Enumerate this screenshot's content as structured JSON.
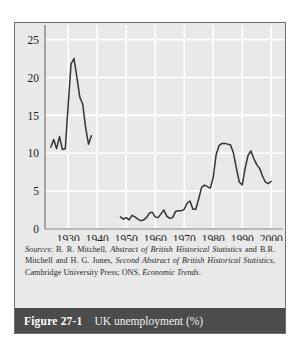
{
  "figure": {
    "number_label": "Figure 27-1",
    "title": "UK unemployment (%)",
    "caption_bar_color": "#4c4c4c",
    "caption_text_color": "#ffffff"
  },
  "sources": {
    "lead": "Sources",
    "colon": ": ",
    "part1": "B. R. Mitchell, ",
    "italic1": "Abstract of British Historical Statistics",
    "part2": " and B.R. Mitchell and H. G. Jones, ",
    "italic2": "Second Abstract of British Historical Statistics",
    "part3": ", Cambridge University Press; ONS, ",
    "italic3": "Economic Trends",
    "part4": "."
  },
  "chart_data": {
    "type": "line",
    "title": "UK unemployment (%)",
    "xlabel": "",
    "ylabel": "",
    "xlim": [
      1922,
      2002
    ],
    "ylim": [
      0,
      26
    ],
    "yticks": [
      0,
      5,
      10,
      15,
      20,
      25
    ],
    "xticks": [
      1930,
      1940,
      1950,
      1960,
      1970,
      1980,
      1990,
      2000
    ],
    "grid": true,
    "grid_color": "#ffffff",
    "plot_bg": "#e9e9e9",
    "line_color": "#333333",
    "legend": "none",
    "series": [
      {
        "name": "UK unemployment rate (interwar)",
        "x": [
          1924,
          1925,
          1926,
          1927,
          1928,
          1929,
          1930,
          1931,
          1932,
          1933,
          1934,
          1935,
          1936,
          1937,
          1938
        ],
        "values": [
          10.8,
          11.8,
          10.6,
          12.2,
          10.5,
          10.6,
          16.4,
          21.8,
          22.5,
          20.0,
          17.4,
          16.5,
          13.4,
          11.2,
          12.3
        ]
      },
      {
        "name": "UK unemployment rate (post-war)",
        "x": [
          1948,
          1949,
          1950,
          1951,
          1952,
          1953,
          1954,
          1955,
          1956,
          1957,
          1958,
          1959,
          1960,
          1961,
          1962,
          1963,
          1964,
          1965,
          1966,
          1967,
          1968,
          1969,
          1970,
          1971,
          1972,
          1973,
          1974,
          1975,
          1976,
          1977,
          1978,
          1979,
          1980,
          1981,
          1982,
          1983,
          1984,
          1985,
          1986,
          1987,
          1988,
          1989,
          1990,
          1991,
          1992,
          1993,
          1994,
          1995,
          1996,
          1997,
          1998,
          1999,
          2000
        ],
        "values": [
          1.6,
          1.3,
          1.5,
          1.2,
          1.8,
          1.6,
          1.3,
          1.1,
          1.2,
          1.5,
          2.1,
          2.2,
          1.6,
          1.5,
          2.0,
          2.5,
          1.7,
          1.4,
          1.5,
          2.3,
          2.4,
          2.4,
          2.6,
          3.4,
          3.7,
          2.6,
          2.6,
          4.0,
          5.5,
          5.8,
          5.6,
          5.4,
          6.8,
          9.8,
          11.0,
          11.3,
          11.3,
          11.2,
          11.1,
          10.0,
          8.0,
          6.2,
          5.8,
          8.0,
          9.7,
          10.3,
          9.3,
          8.5,
          8.0,
          7.0,
          6.2,
          6.0,
          6.3
        ]
      }
    ]
  }
}
